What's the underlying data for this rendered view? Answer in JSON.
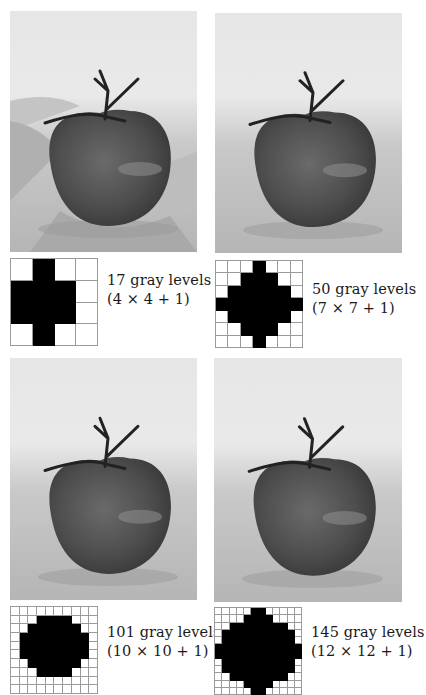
{
  "panels": [
    {
      "id": "p17",
      "photo": {
        "x": 10,
        "y": 11,
        "w": 187,
        "h": 241,
        "posterized": true,
        "subject": "tomato"
      },
      "grid": {
        "x": 10,
        "y": 258,
        "size": 88,
        "n": 4,
        "rows": [
          [
            1
          ],
          [
            0,
            1,
            2
          ],
          [
            0,
            1,
            2
          ],
          [
            1
          ]
        ]
      },
      "caption": {
        "x": 107,
        "y": 271,
        "line1": "17 gray levels",
        "line2": "(4 × 4 + 1)"
      }
    },
    {
      "id": "p50",
      "photo": {
        "x": 215,
        "y": 13,
        "w": 187,
        "h": 240,
        "posterized": false,
        "subject": "tomato"
      },
      "grid": {
        "x": 215,
        "y": 260,
        "size": 88,
        "n": 7,
        "rows": [
          [
            3
          ],
          [
            2,
            3,
            4
          ],
          [
            1,
            2,
            3,
            4,
            5
          ],
          [
            0,
            1,
            2,
            3,
            4,
            5,
            6
          ],
          [
            1,
            2,
            3,
            4,
            5
          ],
          [
            2,
            3,
            4
          ],
          [
            3
          ]
        ]
      },
      "caption": {
        "x": 312,
        "y": 280,
        "line1": "50 gray levels",
        "line2": "(7 × 7 + 1)"
      }
    },
    {
      "id": "p101",
      "photo": {
        "x": 10,
        "y": 358,
        "w": 187,
        "h": 242,
        "posterized": false,
        "subject": "tomato"
      },
      "grid": {
        "x": 10,
        "y": 606,
        "size": 88,
        "n": 10,
        "rows": [
          [],
          [
            3,
            4,
            5,
            6
          ],
          [
            2,
            3,
            4,
            5,
            6,
            7
          ],
          [
            1,
            2,
            3,
            4,
            5,
            6,
            7,
            8
          ],
          [
            1,
            2,
            3,
            4,
            5,
            6,
            7,
            8
          ],
          [
            1,
            2,
            3,
            4,
            5,
            6,
            7,
            8
          ],
          [
            2,
            3,
            4,
            5,
            6,
            7
          ],
          [
            3,
            4,
            5,
            6
          ],
          [],
          []
        ]
      },
      "caption": {
        "x": 107,
        "y": 623,
        "line1": "101 gray levels",
        "line2": "(10 × 10 + 1)"
      }
    },
    {
      "id": "p145",
      "photo": {
        "x": 214,
        "y": 358,
        "w": 188,
        "h": 244,
        "posterized": false,
        "subject": "tomato"
      },
      "grid": {
        "x": 214,
        "y": 607,
        "size": 88,
        "n": 12,
        "rows": [
          [
            5,
            6
          ],
          [
            4,
            5,
            6,
            7
          ],
          [
            2,
            3,
            4,
            5,
            6,
            7,
            8,
            9
          ],
          [
            1,
            2,
            3,
            4,
            5,
            6,
            7,
            8,
            9,
            10
          ],
          [
            1,
            2,
            3,
            4,
            5,
            6,
            7,
            8,
            9,
            10
          ],
          [
            0,
            1,
            2,
            3,
            4,
            5,
            6,
            7,
            8,
            9,
            10,
            11
          ],
          [
            0,
            1,
            2,
            3,
            4,
            5,
            6,
            7,
            8,
            9,
            10,
            11
          ],
          [
            1,
            2,
            3,
            4,
            5,
            6,
            7,
            8,
            9,
            10
          ],
          [
            1,
            2,
            3,
            4,
            5,
            6,
            7,
            8,
            9,
            10
          ],
          [
            2,
            3,
            4,
            5,
            6,
            7,
            8,
            9
          ],
          [
            4,
            5,
            6,
            7
          ],
          [
            5,
            6
          ]
        ]
      },
      "caption": {
        "x": 311,
        "y": 623,
        "line1": "145 gray levels",
        "line2": "(12 × 12 + 1)"
      }
    }
  ]
}
